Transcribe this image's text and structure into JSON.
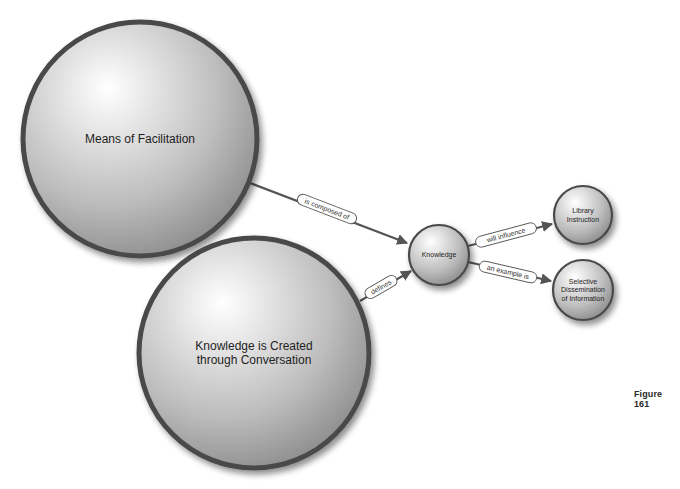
{
  "diagram": {
    "type": "concept-map",
    "nodes": [
      {
        "id": "means",
        "label_lines": [
          "Means of Facilitation"
        ],
        "cx": 140,
        "cy": 139,
        "r": 117,
        "font_size": 12
      },
      {
        "id": "created",
        "label_lines": [
          "Knowledge is Created",
          "through Conversation"
        ],
        "cx": 254,
        "cy": 353,
        "r": 115,
        "font_size": 12
      },
      {
        "id": "knowledge",
        "label_lines": [
          "Knowledge"
        ],
        "cx": 439,
        "cy": 255,
        "r": 30,
        "font_size": 7
      },
      {
        "id": "library",
        "label_lines": [
          "Library",
          "Instruction"
        ],
        "cx": 583,
        "cy": 215,
        "r": 29,
        "font_size": 7
      },
      {
        "id": "sdi",
        "label_lines": [
          "Selective",
          "Dissemination",
          "of Information"
        ],
        "cx": 583,
        "cy": 290,
        "r": 30,
        "font_size": 7
      }
    ],
    "edges": [
      {
        "from": "means",
        "to": "knowledge",
        "label": "is composed of",
        "x1": 250,
        "y1": 183,
        "x2": 407,
        "y2": 243,
        "lx": 327,
        "ly": 209,
        "angle": 21
      },
      {
        "from": "created",
        "to": "knowledge",
        "label": "defines",
        "x1": 360,
        "y1": 301,
        "x2": 411,
        "y2": 271,
        "lx": 381,
        "ly": 287,
        "angle": -30
      },
      {
        "from": "knowledge",
        "to": "library",
        "label": "will influence",
        "x1": 468,
        "y1": 246,
        "x2": 552,
        "y2": 224,
        "lx": 506,
        "ly": 235,
        "angle": -15
      },
      {
        "from": "knowledge",
        "to": "sdi",
        "label": "an example is",
        "x1": 468,
        "y1": 262,
        "x2": 551,
        "y2": 281,
        "lx": 508,
        "ly": 272,
        "angle": 13
      }
    ]
  },
  "caption": "Figure 161",
  "colors": {
    "node_stroke": "#4a4a4a",
    "node_fill_light": "#ffffff",
    "node_fill_mid": "#cfcfcf",
    "node_fill_dark": "#9a9a9a",
    "edge": "#555555"
  }
}
